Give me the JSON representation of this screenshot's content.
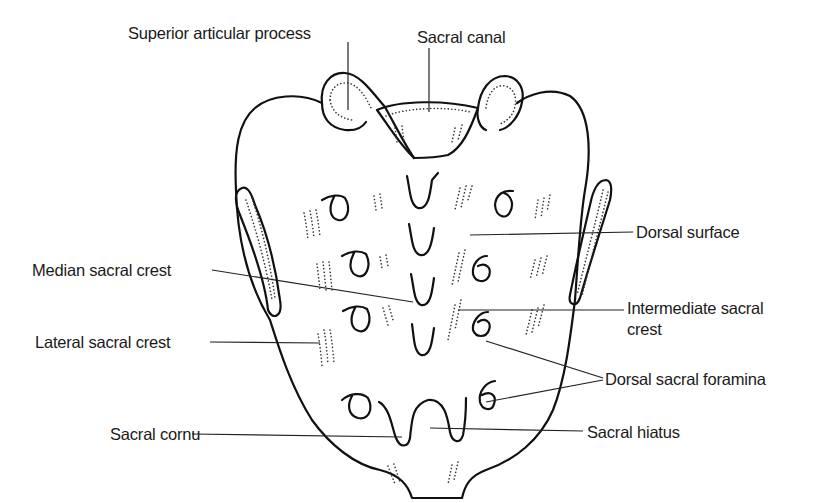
{
  "diagram": {
    "labels": {
      "superior_articular_process": "Superior articular process",
      "sacral_canal": "Sacral canal",
      "dorsal_surface": "Dorsal surface",
      "median_sacral_crest": "Median sacral crest",
      "intermediate_sacral_crest_line1": "Intermediate sacral",
      "intermediate_sacral_crest_line2": "crest",
      "lateral_sacral_crest": "Lateral sacral crest",
      "dorsal_sacral_foramina": "Dorsal sacral foramina",
      "sacral_cornu": "Sacral cornu",
      "sacral_hiatus": "Sacral hiatus"
    },
    "colors": {
      "line": "#111111",
      "text": "#1a1a1a",
      "background": "#ffffff"
    }
  }
}
